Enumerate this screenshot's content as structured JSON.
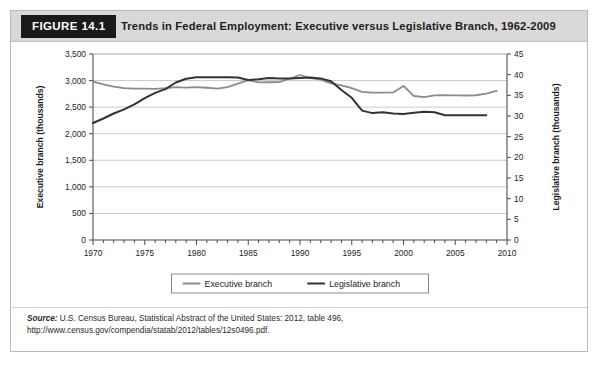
{
  "figure": {
    "tag": "FIGURE 14.1",
    "title": "Trends in Federal Employment: Executive versus Legislative Branch, 1962-2009",
    "source_prefix": "Source:",
    "source_text": " U.S. Census Bureau, Statistical Abstract of the United States: 2012, table 496, http://www.census.gov/compendia/statab/2012/tables/12s0496.pdf."
  },
  "colors": {
    "tag_background": "#1a1a1a",
    "header_background": "#d9d9d9",
    "executive_line": "#8c8c8c",
    "legislative_line": "#333333",
    "grid": "#bdbdbd",
    "axis": "#4d4d4d",
    "card_border": "#b9b9b9"
  },
  "chart_data": {
    "type": "line",
    "title": "Trends in Federal Employment: Executive versus Legislative Branch, 1962-2009",
    "xlabel": "",
    "ylabel": "Executive branch (thousands)",
    "y2label": "Legislative branch (thousands)",
    "xlim": [
      1970,
      2010
    ],
    "ylim": [
      0,
      3500
    ],
    "y2lim": [
      0,
      45
    ],
    "yticks": [
      0,
      500,
      1000,
      1500,
      2000,
      2500,
      3000,
      3500
    ],
    "ytick_labels": [
      "0",
      "500",
      "1,000",
      "1,500",
      "2,000",
      "2,500",
      "3,000",
      "3,500"
    ],
    "y2ticks": [
      0,
      5,
      10,
      15,
      20,
      25,
      30,
      35,
      40,
      45
    ],
    "y2tick_labels": [
      "0",
      "5",
      "10",
      "15",
      "20",
      "25",
      "30",
      "35",
      "40",
      "45"
    ],
    "xticks": [
      1970,
      1975,
      1980,
      1985,
      1990,
      1995,
      2000,
      2005,
      2010
    ],
    "xtick_labels": [
      "1970",
      "1975",
      "1980",
      "1985",
      "1990",
      "1995",
      "2000",
      "2005",
      "2010"
    ],
    "xtick_minor_step": 1,
    "grid": "horizontal",
    "legend_position": "bottom-center",
    "series": [
      {
        "name": "Executive branch",
        "axis": "left",
        "color": "#8c8c8c",
        "x": [
          1970,
          1971,
          1972,
          1973,
          1974,
          1975,
          1976,
          1977,
          1978,
          1979,
          1980,
          1981,
          1982,
          1983,
          1984,
          1985,
          1986,
          1987,
          1988,
          1989,
          1990,
          1991,
          1992,
          1993,
          1994,
          1995,
          1996,
          1997,
          1998,
          1999,
          2000,
          2001,
          2002,
          2003,
          2004,
          2005,
          2006,
          2007,
          2008,
          2009
        ],
        "values": [
          2982,
          2930,
          2885,
          2859,
          2847,
          2848,
          2843,
          2856,
          2875,
          2869,
          2876,
          2865,
          2848,
          2875,
          2942,
          3008,
          2966,
          2968,
          2972,
          3034,
          3105,
          3048,
          3017,
          2947,
          2908,
          2858,
          2786,
          2772,
          2772,
          2777,
          2899,
          2710,
          2690,
          2721,
          2726,
          2720,
          2719,
          2724,
          2756,
          2804
        ]
      },
      {
        "name": "Legislative branch",
        "axis": "right",
        "color": "#333333",
        "x": [
          1970,
          1971,
          1972,
          1973,
          1974,
          1975,
          1976,
          1977,
          1978,
          1979,
          1980,
          1981,
          1982,
          1983,
          1984,
          1985,
          1986,
          1987,
          1988,
          1989,
          1990,
          1991,
          1992,
          1993,
          1994,
          1995,
          1996,
          1997,
          1998,
          1999,
          2000,
          2001,
          2002,
          2003,
          2004,
          2005,
          2006,
          2007,
          2008
        ],
        "values": [
          28.3,
          29.4,
          30.6,
          31.6,
          32.8,
          34.3,
          35.6,
          36.5,
          38.1,
          39.0,
          39.4,
          39.4,
          39.4,
          39.4,
          39.3,
          38.7,
          38.9,
          39.2,
          39.1,
          39.1,
          39.2,
          39.3,
          39.1,
          38.4,
          36.3,
          34.4,
          31.3,
          30.7,
          30.9,
          30.6,
          30.5,
          30.8,
          31.0,
          30.9,
          30.2,
          30.2,
          30.2,
          30.2,
          30.2
        ]
      }
    ]
  },
  "legend": {
    "items": [
      {
        "label": "Executive branch",
        "color": "#8c8c8c"
      },
      {
        "label": "Legislative branch",
        "color": "#333333"
      }
    ]
  }
}
